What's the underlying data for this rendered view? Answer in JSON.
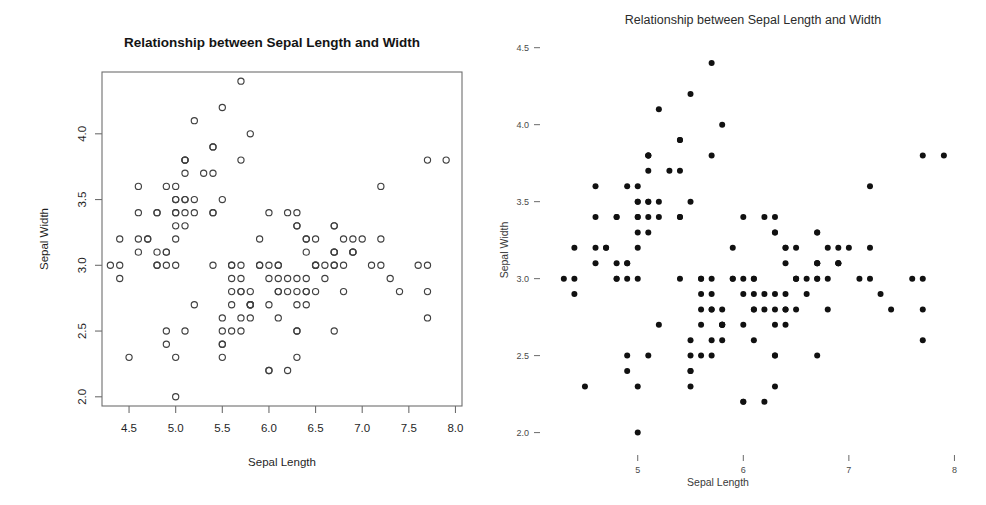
{
  "figure": {
    "panels": [
      {
        "id": "left",
        "style_name": "base-r-scatter",
        "title": "Relationship between Sepal Length and Width",
        "xlabel": "Sepal Length",
        "ylabel": "Sepal Width",
        "marker": "open-circle",
        "frame": "box",
        "xticks": [
          "4.5",
          "5.0",
          "5.5",
          "6.0",
          "6.5",
          "7.0",
          "7.5",
          "8.0"
        ],
        "xtick_values": [
          4.5,
          5.0,
          5.5,
          6.0,
          6.5,
          7.0,
          7.5,
          8.0
        ],
        "yticks": [
          "2.0",
          "2.5",
          "3.0",
          "3.5",
          "4.0"
        ],
        "ytick_values": [
          2.0,
          2.5,
          3.0,
          3.5,
          4.0
        ],
        "ylim": [
          1.93,
          4.47
        ],
        "xlim": [
          4.21,
          8.07
        ],
        "axis_color": "#6e6e6e",
        "point_color": "#404040"
      },
      {
        "id": "right",
        "style_name": "minimal-scatter",
        "title": "Relationship between Sepal Length and Width",
        "xlabel": "Sepal Length",
        "ylabel": "Sepal Width",
        "marker": "filled-dot",
        "frame": "none",
        "xticks": [
          "5",
          "6",
          "7",
          "8"
        ],
        "xtick_values": [
          5,
          6,
          7,
          8
        ],
        "yticks": [
          "4.5",
          "4.0",
          "3.5",
          "3.0",
          "2.5",
          "2.0"
        ],
        "ytick_values": [
          4.5,
          4.0,
          3.5,
          3.0,
          2.5,
          2.0
        ],
        "ylim": [
          1.9,
          4.55
        ],
        "xlim": [
          4.15,
          8.1
        ],
        "axis_color": "#6a6a6a",
        "point_color": "#111111"
      }
    ]
  },
  "chart_data": {
    "type": "scatter",
    "title": "Relationship between Sepal Length and Width",
    "xlabel": "Sepal Length",
    "ylabel": "Sepal Width",
    "xlim": [
      4.2,
      8.1
    ],
    "ylim": [
      1.9,
      4.5
    ],
    "grid": false,
    "legend": "none",
    "n_points": 150,
    "series": [
      {
        "name": "iris sepal measurements",
        "x": [
          5.1,
          4.9,
          4.7,
          4.6,
          5.0,
          5.4,
          4.6,
          5.0,
          4.4,
          4.9,
          5.4,
          4.8,
          4.8,
          4.3,
          5.8,
          5.7,
          5.4,
          5.1,
          5.7,
          5.1,
          5.4,
          5.1,
          4.6,
          5.1,
          4.8,
          5.0,
          5.0,
          5.2,
          5.2,
          4.7,
          4.8,
          5.4,
          5.2,
          5.5,
          4.9,
          5.0,
          5.5,
          4.9,
          4.4,
          5.1,
          5.0,
          4.5,
          4.4,
          5.0,
          5.1,
          4.8,
          5.1,
          4.6,
          5.3,
          5.0,
          7.0,
          6.4,
          6.9,
          5.5,
          6.5,
          5.7,
          6.3,
          4.9,
          6.6,
          5.2,
          5.0,
          5.9,
          6.0,
          6.1,
          5.6,
          6.7,
          5.6,
          5.8,
          6.2,
          5.6,
          5.9,
          6.1,
          6.3,
          6.1,
          6.4,
          6.6,
          6.8,
          6.7,
          6.0,
          5.7,
          5.5,
          5.5,
          5.8,
          6.0,
          5.4,
          6.0,
          6.7,
          6.3,
          5.6,
          5.5,
          5.5,
          6.1,
          5.8,
          5.0,
          5.6,
          5.7,
          5.7,
          6.2,
          5.1,
          5.7,
          6.3,
          5.8,
          7.1,
          6.3,
          6.5,
          7.6,
          4.9,
          7.3,
          6.7,
          7.2,
          6.5,
          6.4,
          6.8,
          5.7,
          5.8,
          6.4,
          6.5,
          7.7,
          7.7,
          6.0,
          6.9,
          5.6,
          7.7,
          6.3,
          6.7,
          7.2,
          6.2,
          6.1,
          6.4,
          7.2,
          7.4,
          7.9,
          6.4,
          6.3,
          6.1,
          7.7,
          6.3,
          6.4,
          6.0,
          6.9,
          6.7,
          6.9,
          5.8,
          6.8,
          6.7,
          6.7,
          6.3,
          6.5,
          6.2,
          5.9
        ],
        "y": [
          3.5,
          3.0,
          3.2,
          3.1,
          3.6,
          3.9,
          3.4,
          3.4,
          2.9,
          3.1,
          3.7,
          3.4,
          3.0,
          3.0,
          4.0,
          4.4,
          3.9,
          3.5,
          3.8,
          3.8,
          3.4,
          3.7,
          3.6,
          3.3,
          3.4,
          3.0,
          3.4,
          3.5,
          3.4,
          3.2,
          3.1,
          3.4,
          4.1,
          4.2,
          3.1,
          3.2,
          3.5,
          3.6,
          3.0,
          3.4,
          3.5,
          2.3,
          3.2,
          3.5,
          3.8,
          3.0,
          3.8,
          3.2,
          3.7,
          3.3,
          3.2,
          3.2,
          3.1,
          2.3,
          2.8,
          2.8,
          3.3,
          2.4,
          2.9,
          2.7,
          2.0,
          3.0,
          2.2,
          2.9,
          2.9,
          3.1,
          3.0,
          2.7,
          2.2,
          2.5,
          3.2,
          2.8,
          2.5,
          2.8,
          2.9,
          3.0,
          2.8,
          3.0,
          2.9,
          2.6,
          2.4,
          2.4,
          2.7,
          2.7,
          3.0,
          3.4,
          3.1,
          2.3,
          3.0,
          2.5,
          2.6,
          3.0,
          2.6,
          2.3,
          2.7,
          3.0,
          2.9,
          2.9,
          2.5,
          2.8,
          3.3,
          2.7,
          3.0,
          2.9,
          3.0,
          3.0,
          2.5,
          2.9,
          2.5,
          3.6,
          3.2,
          2.7,
          3.0,
          2.5,
          2.8,
          3.2,
          3.0,
          3.8,
          2.6,
          2.2,
          3.2,
          2.8,
          2.8,
          2.7,
          3.3,
          3.2,
          2.8,
          3.0,
          2.8,
          3.0,
          2.8,
          3.8,
          2.8,
          2.8,
          2.6,
          3.0,
          3.4,
          3.1,
          3.0,
          3.1,
          3.1,
          3.1,
          2.7,
          3.2,
          3.3,
          3.0,
          2.5,
          3.0,
          3.4,
          3.0
        ]
      }
    ]
  }
}
